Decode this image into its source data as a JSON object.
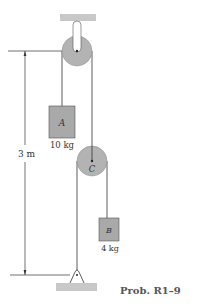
{
  "figure": {
    "caption": "Prob. R1–9",
    "dimension": {
      "label": "3 m"
    },
    "block_a": {
      "label": "A",
      "mass": "10 kg"
    },
    "block_b": {
      "label": "B",
      "mass": "4 kg"
    },
    "pulley_c": {
      "label": "C"
    },
    "colors": {
      "fill_gray": "#a9a9a9",
      "pulley_gray": "#b3b3b3",
      "support_gray": "#c8c8c8",
      "line": "#333333"
    }
  }
}
